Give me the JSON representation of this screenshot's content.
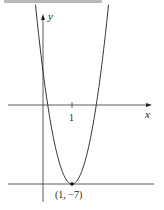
{
  "figure": {
    "y_axis_label": "y",
    "x_axis_label": "x",
    "x_tick_label": "1",
    "vertex_label": "(1, −7)"
  },
  "chart_data": {
    "type": "line",
    "title": "",
    "xlabel": "x",
    "ylabel": "y",
    "function": "y = 10(x − 1)² − 7",
    "vertex": [
      1,
      -7
    ],
    "x_ticks": [
      1
    ],
    "horizontal_reference_line": -7,
    "annotations": [
      "(1, −7)"
    ],
    "grid": false
  },
  "colors": {
    "ink": "#222222",
    "topbar": "#b8b8b8"
  }
}
